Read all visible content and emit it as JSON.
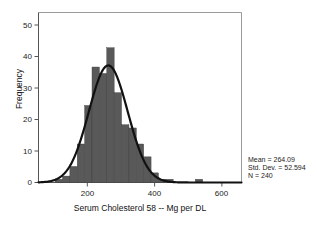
{
  "chart_data": {
    "type": "bar",
    "title": "",
    "subtitle": "",
    "xlabel": "Serum Cholesterol 58 -- Mg per DL",
    "ylabel": "Frequency",
    "xlim": [
      75,
      625
    ],
    "ylim": [
      0,
      53
    ],
    "xticks": [
      200,
      400,
      600
    ],
    "xtick_labels": [
      "200",
      "400",
      "600"
    ],
    "yticks": [
      0,
      10,
      20,
      30,
      40,
      50
    ],
    "ytick_labels": [
      "0",
      "10",
      "20",
      "30",
      "40",
      "50"
    ],
    "grid": false,
    "legend": "none",
    "bin_width": 20,
    "bin_centers": [
      110,
      130,
      150,
      170,
      190,
      210,
      230,
      250,
      270,
      290,
      310,
      330,
      350,
      370,
      390,
      410,
      430,
      450,
      470,
      490,
      510,
      530
    ],
    "values": [
      0,
      1,
      2,
      5,
      12,
      24,
      36,
      34,
      42,
      28,
      18,
      17,
      12,
      8,
      3,
      1,
      1,
      0,
      0,
      0,
      1,
      0
    ],
    "bar_color": "#595959",
    "overlay": {
      "type": "normal-curve",
      "label": "normal distribution curve",
      "color": "#111111",
      "mean": 264.09,
      "std_dev": 52.594,
      "n": 240,
      "peak_value": 36.5
    },
    "annotations": {
      "mean_label": "Mean = 264.09",
      "std_dev_label": "Std. Dev. = 52.594",
      "n_label": "N = 240"
    }
  },
  "stats_panel": {
    "mean": "Mean = 264.09",
    "std_dev": "Std. Dev. = 52.594",
    "n": "N = 240"
  },
  "axes": {
    "x_title": "Serum Cholesterol 58 -- Mg per DL",
    "y_title": "Frequency",
    "x_tick_1": "200",
    "x_tick_2": "400",
    "x_tick_3": "600",
    "y_tick_0": "0",
    "y_tick_1": "10",
    "y_tick_2": "20",
    "y_tick_3": "30",
    "y_tick_4": "40",
    "y_tick_5": "50"
  }
}
